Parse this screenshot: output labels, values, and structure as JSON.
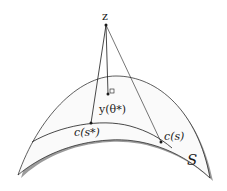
{
  "diagram": {
    "labels": {
      "z": "z",
      "y_theta": "y(θ*)",
      "c_s_star": "c(s*)",
      "c_s": "c(s)",
      "surface": "S"
    },
    "colors": {
      "stroke": "#1a1a1a",
      "surface_fill": "#ffffff",
      "shadow": "#8a8a8a"
    }
  }
}
